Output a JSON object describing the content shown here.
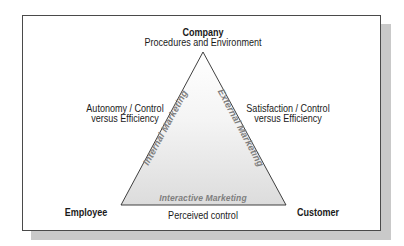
{
  "diagram": {
    "type": "services-marketing-triangle",
    "vertices": {
      "top": {
        "title": "Company",
        "subtitle": "Procedures and Environment"
      },
      "left": {
        "title": "Employee"
      },
      "right": {
        "title": "Customer"
      }
    },
    "edges": {
      "left": {
        "label": "Internal Marketing",
        "annotation_line1": "Autonomy / Control",
        "annotation_line2": "versus Efficiency"
      },
      "right": {
        "label": "External Marketing",
        "annotation_line1": "Satisfaction / Control",
        "annotation_line2": "versus Efficiency"
      },
      "bottom": {
        "label": "Interactive Marketing",
        "annotation": "Perceived control"
      }
    },
    "colors": {
      "frame_border": "#4a4a4a",
      "shadow": "#c9c9c9",
      "triangle_stroke": "#2a2a2a",
      "triangle_fill_top": "#ffffff",
      "triangle_fill_bottom": "#dedede",
      "edge_label": "#7e7e7e",
      "text": "#1a1a1a"
    }
  }
}
